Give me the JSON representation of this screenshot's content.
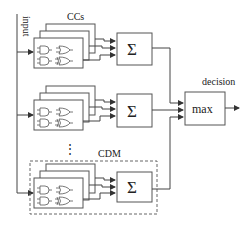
{
  "diagram": {
    "labels": {
      "input": "input",
      "ccs": "CCs",
      "cdm": "CDM",
      "decision": "decision",
      "max": "max",
      "sum_symbol": "Σ",
      "ellipsis": "⋮"
    },
    "branches": [
      {
        "name": "branch-1",
        "cc_stack": "CCs",
        "aggregator": "Σ"
      },
      {
        "name": "branch-2",
        "cc_stack": "CCs",
        "aggregator": "Σ"
      },
      {
        "name": "branch-n",
        "cc_stack": "CCs",
        "aggregator": "Σ",
        "group_label": "CDM"
      }
    ],
    "output": {
      "node": "max",
      "label": "decision"
    }
  }
}
